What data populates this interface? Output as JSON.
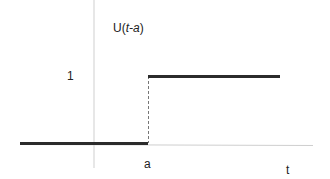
{
  "diagram": {
    "function_label_prefix": "U(",
    "function_label_var": "t-a",
    "function_label_suffix": ")",
    "y_tick_label": "1",
    "step_label": "a",
    "x_axis_label": "t",
    "colors": {
      "axis": "#c8c8c8",
      "step_line": "#2b2b2b",
      "dashed": "#666666",
      "text": "#222222"
    }
  }
}
